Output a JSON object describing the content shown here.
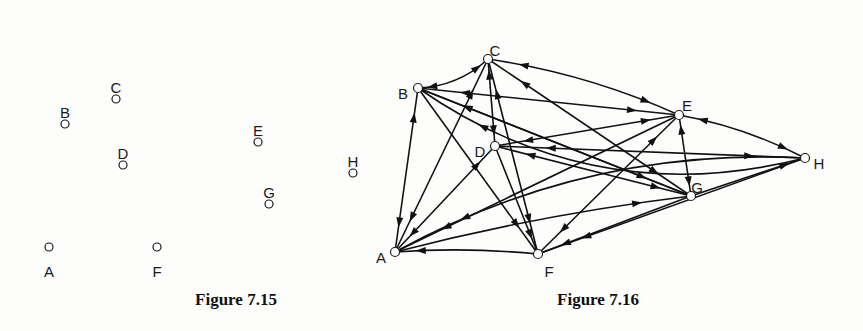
{
  "figures": [
    {
      "caption": "Figure 7.15",
      "nodes": [
        {
          "id": "A",
          "label": "A",
          "x": 49,
          "y": 247,
          "lx": 49,
          "ly": 272
        },
        {
          "id": "B",
          "label": "B",
          "x": 65,
          "y": 124,
          "lx": 65,
          "ly": 113
        },
        {
          "id": "C",
          "label": "C",
          "x": 116,
          "y": 99,
          "lx": 116,
          "ly": 88
        },
        {
          "id": "D",
          "label": "D",
          "x": 123,
          "y": 165,
          "lx": 123,
          "ly": 154
        },
        {
          "id": "E",
          "label": "E",
          "x": 258,
          "y": 142,
          "lx": 258,
          "ly": 131
        },
        {
          "id": "F",
          "label": "F",
          "x": 157,
          "y": 247,
          "lx": 157,
          "ly": 272
        },
        {
          "id": "G",
          "label": "G",
          "x": 269,
          "y": 204,
          "lx": 269,
          "ly": 193
        },
        {
          "id": "H",
          "label": "H",
          "x": 353,
          "y": 173,
          "lx": 353,
          "ly": 162
        }
      ]
    },
    {
      "caption": "Figure 7.16",
      "nodes": [
        {
          "id": "A",
          "label": "A",
          "x": 395,
          "y": 252,
          "lx": 381,
          "ly": 258
        },
        {
          "id": "B",
          "label": "B",
          "x": 418,
          "y": 88,
          "lx": 403,
          "ly": 94
        },
        {
          "id": "C",
          "label": "C",
          "x": 488,
          "y": 59,
          "lx": 495,
          "ly": 51
        },
        {
          "id": "D",
          "label": "D",
          "x": 495,
          "y": 146,
          "lx": 480,
          "ly": 152
        },
        {
          "id": "E",
          "label": "E",
          "x": 679,
          "y": 115,
          "lx": 687,
          "ly": 106
        },
        {
          "id": "F",
          "label": "F",
          "x": 538,
          "y": 254,
          "lx": 549,
          "ly": 272
        },
        {
          "id": "G",
          "label": "G",
          "x": 691,
          "y": 196,
          "lx": 697,
          "ly": 188
        },
        {
          "id": "H",
          "label": "H",
          "x": 805,
          "y": 158,
          "lx": 819,
          "ly": 164
        }
      ],
      "edges": [
        {
          "from": "C",
          "to": "B",
          "bidirectional": true,
          "curve": -14
        },
        {
          "from": "H",
          "to": "B",
          "curve": -90
        },
        {
          "from": "A",
          "to": "B",
          "bidirectional": true,
          "curve": 0
        },
        {
          "from": "E",
          "to": "B",
          "bidirectional": true,
          "curve": 0
        },
        {
          "from": "G",
          "to": "B",
          "curve": 0
        },
        {
          "from": "B",
          "to": "F",
          "curve": 0
        },
        {
          "from": "B",
          "to": "G",
          "bidirectional": true,
          "curve": 0
        },
        {
          "from": "C",
          "to": "D",
          "bidirectional": true,
          "curve": 0
        },
        {
          "from": "C",
          "to": "F",
          "bidirectional": true,
          "curve": 0
        },
        {
          "from": "D",
          "to": "F",
          "curve": 0
        },
        {
          "from": "C",
          "to": "E",
          "bidirectional": true,
          "curve": -14
        },
        {
          "from": "C",
          "to": "G",
          "bidirectional": true,
          "curve": 0
        },
        {
          "from": "C",
          "to": "A",
          "bidirectional": true,
          "curve": 0
        },
        {
          "from": "D",
          "to": "A",
          "bidirectional": true,
          "curve": 0
        },
        {
          "from": "E",
          "to": "D",
          "bidirectional": true,
          "curve": 0
        },
        {
          "from": "D",
          "to": "H",
          "bidirectional": true,
          "curve": 0
        },
        {
          "from": "D",
          "to": "G",
          "bidirectional": true,
          "curve": 0
        },
        {
          "from": "E",
          "to": "A",
          "curve": 0
        },
        {
          "from": "E",
          "to": "F",
          "bidirectional": true,
          "curve": 0
        },
        {
          "from": "E",
          "to": "G",
          "bidirectional": true,
          "curve": 0
        },
        {
          "from": "E",
          "to": "H",
          "bidirectional": true,
          "curve": -10
        },
        {
          "from": "G",
          "to": "H",
          "curve": 0
        },
        {
          "from": "A",
          "to": "G",
          "curve": -10
        },
        {
          "from": "G",
          "to": "F",
          "curve": 0
        },
        {
          "from": "H",
          "to": "F",
          "curve": 0
        },
        {
          "from": "F",
          "to": "A",
          "curve": 6
        },
        {
          "from": "H",
          "to": "A",
          "curve": 60
        }
      ]
    }
  ]
}
